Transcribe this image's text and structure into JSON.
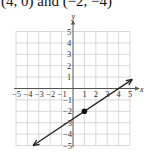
{
  "caption": "(4, 0) and (−2, −4)",
  "chart_data": {
    "type": "line",
    "title": "",
    "xlabel": "x",
    "ylabel": "y",
    "xlim": [
      -5,
      5
    ],
    "ylim": [
      -5,
      5
    ],
    "grid": true,
    "x_ticks": [
      "-5",
      "-4",
      "-3",
      "-2",
      "-1",
      "1",
      "2",
      "3",
      "4",
      "5"
    ],
    "y_ticks": [
      "5",
      "4",
      "3",
      "2",
      "1",
      "-1",
      "-2",
      "-3",
      "-4",
      "-5"
    ],
    "series": [
      {
        "name": "line through (4, 0) and (-2, -4)",
        "equation": "y = (2/3)x - 8/3",
        "slope": 0.6667,
        "y_intercept": -2.6667,
        "arrows_both_ends": true,
        "x": [
          -3.5,
          5.2
        ],
        "y": [
          -5.0,
          0.8
        ]
      }
    ],
    "points": [
      {
        "x": 1,
        "y": -2,
        "marker": "filled-circle"
      }
    ]
  },
  "colors": {
    "grid": "#cfcfcf",
    "axis": "#555555",
    "line": "#222222",
    "point": "#111111"
  }
}
